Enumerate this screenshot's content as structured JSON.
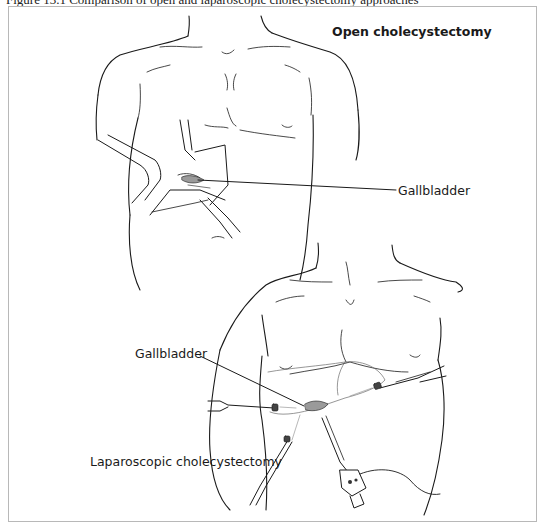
{
  "figure": {
    "caption": "Figure 13.1 Comparison of open and laparoscopic cholecystectomy approaches",
    "frame_color": "#b8b8b8",
    "line_color": "#1a1a1a",
    "gallbladder_fill": "#9a9a9a"
  },
  "panels": {
    "open": {
      "title": "Open cholecystectomy",
      "labels": [
        {
          "text": "Gallbladder"
        }
      ]
    },
    "laparoscopic": {
      "title": "Laparoscopic cholecystectomy",
      "labels": [
        {
          "text": "Gallbladder"
        }
      ]
    }
  }
}
